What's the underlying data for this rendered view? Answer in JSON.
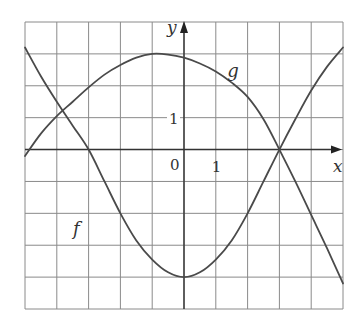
{
  "chart_data": {
    "type": "line",
    "title": "",
    "xlabel": "x",
    "ylabel": "y",
    "xlim": [
      -5,
      5
    ],
    "ylim": [
      -5,
      4
    ],
    "grid": true,
    "grid_step": 1,
    "tick_labels": {
      "origin": "0",
      "x_one": "1",
      "y_one": "1"
    },
    "series": [
      {
        "name": "f",
        "label_pos": [
          -3.3,
          -2.5
        ],
        "points": [
          [
            -5,
            3.2
          ],
          [
            -4.5,
            2.3
          ],
          [
            -4,
            1.5
          ],
          [
            -3.5,
            0.75
          ],
          [
            -3,
            0
          ],
          [
            -2.5,
            -1.0
          ],
          [
            -2,
            -2.0
          ],
          [
            -1.5,
            -2.85
          ],
          [
            -1,
            -3.45
          ],
          [
            -0.5,
            -3.85
          ],
          [
            0,
            -4
          ],
          [
            0.5,
            -3.85
          ],
          [
            1,
            -3.45
          ],
          [
            1.5,
            -2.85
          ],
          [
            2,
            -2.0
          ],
          [
            2.5,
            -1.0
          ],
          [
            3,
            0
          ],
          [
            3.5,
            0.95
          ],
          [
            4,
            1.85
          ],
          [
            4.5,
            2.6
          ],
          [
            5,
            3.2
          ]
        ]
      },
      {
        "name": "g",
        "label_pos": [
          1.55,
          2.45
        ],
        "points": [
          [
            -5,
            -0.2
          ],
          [
            -4.5,
            0.5
          ],
          [
            -4,
            1.05
          ],
          [
            -3.5,
            1.5
          ],
          [
            -3,
            1.95
          ],
          [
            -2.5,
            2.35
          ],
          [
            -2,
            2.65
          ],
          [
            -1.5,
            2.88
          ],
          [
            -1,
            3.0
          ],
          [
            -0.5,
            2.98
          ],
          [
            0,
            2.88
          ],
          [
            0.5,
            2.7
          ],
          [
            1,
            2.45
          ],
          [
            1.5,
            2.1
          ],
          [
            2,
            1.65
          ],
          [
            2.5,
            0.95
          ],
          [
            3,
            0
          ],
          [
            3.5,
            -1.0
          ],
          [
            4,
            -2.05
          ],
          [
            4.5,
            -3.1
          ],
          [
            5,
            -4.2
          ]
        ]
      }
    ]
  }
}
